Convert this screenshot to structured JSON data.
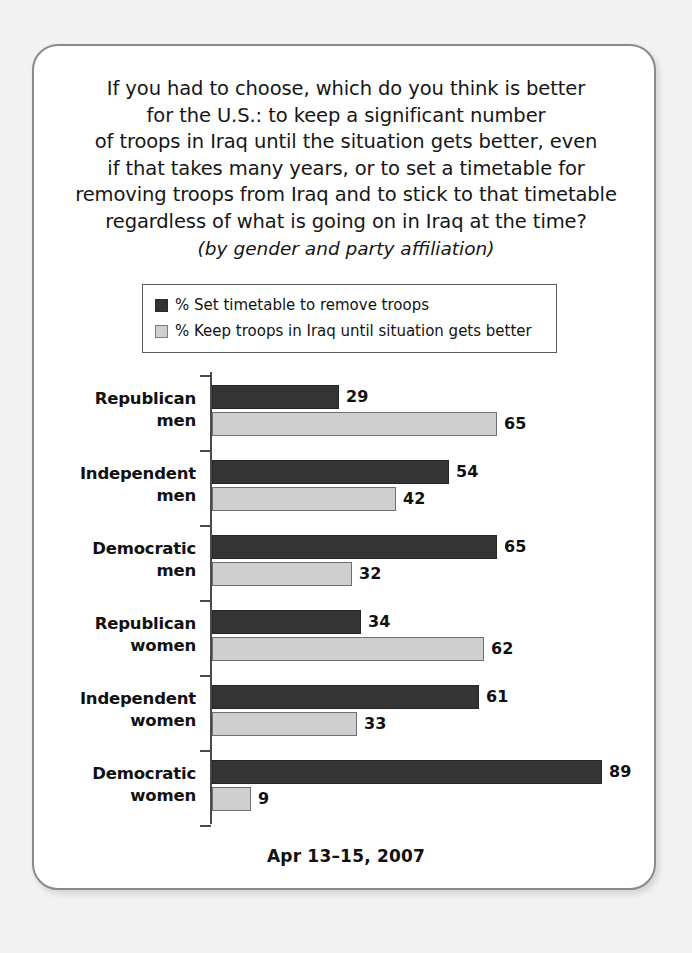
{
  "title": {
    "lines": [
      "If you had to choose, which do you think is better",
      "for the U.S.: to keep a significant number",
      "of troops in Iraq until the situation gets better, even",
      "if that takes many years, or to set a timetable for",
      "removing troops from Iraq and to stick to that timetable",
      "regardless of what is going on in Iraq at the time?"
    ],
    "subtitle": "(by gender and party affiliation)"
  },
  "legend": {
    "entries": [
      {
        "label": "% Set timetable to remove troops",
        "color": "#343434",
        "swatch": "dark"
      },
      {
        "label": "% Keep troops in Iraq until situation gets better",
        "color": "#cfcfcf",
        "swatch": "light"
      }
    ]
  },
  "footer": {
    "date": "Apr 13–15, 2007"
  },
  "chart_data": {
    "type": "bar",
    "orientation": "horizontal",
    "subtitle": "(by gender and party affiliation)",
    "xlabel": "",
    "ylabel": "",
    "xlim": [
      0,
      100
    ],
    "grid": false,
    "legend_position": "top",
    "categories": [
      "Republican men",
      "Independent men",
      "Democratic men",
      "Republican women",
      "Independent women",
      "Democratic women"
    ],
    "category_lines": [
      [
        "Republican",
        "men"
      ],
      [
        "Independent",
        "men"
      ],
      [
        "Democratic",
        "men"
      ],
      [
        "Republican",
        "women"
      ],
      [
        "Independent",
        "women"
      ],
      [
        "Democratic",
        "women"
      ]
    ],
    "series": [
      {
        "name": "% Set timetable to remove troops",
        "color": "#343434",
        "values": [
          29,
          54,
          65,
          34,
          61,
          89
        ]
      },
      {
        "name": "% Keep troops in Iraq until situation gets better",
        "color": "#cfcfcf",
        "values": [
          65,
          42,
          32,
          62,
          33,
          9
        ]
      }
    ],
    "note": "Apr 13–15, 2007"
  }
}
